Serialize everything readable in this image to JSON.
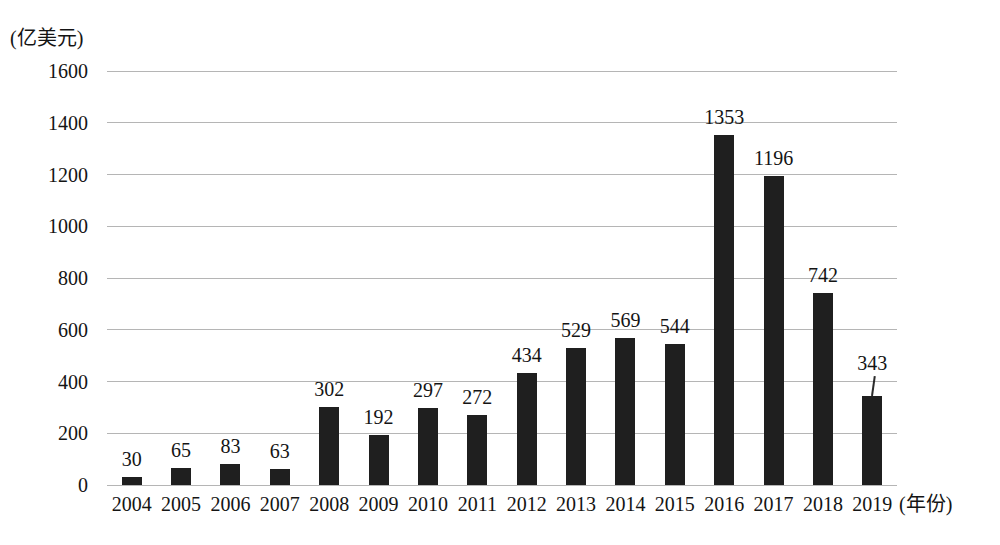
{
  "figure": {
    "background": "#ffffff",
    "text_color": "#141414"
  },
  "chart_data": {
    "type": "bar",
    "title": "",
    "ylabel": "(亿美元)",
    "xlabel": "(年份)",
    "categories": [
      "2004",
      "2005",
      "2006",
      "2007",
      "2008",
      "2009",
      "2010",
      "2011",
      "2012",
      "2013",
      "2014",
      "2015",
      "2016",
      "2017",
      "2018",
      "2019"
    ],
    "values": [
      30,
      65,
      83,
      63,
      302,
      192,
      297,
      272,
      434,
      529,
      569,
      544,
      1353,
      1196,
      742,
      343
    ],
    "ylim": [
      0,
      1600
    ],
    "ytick_step": 200,
    "yticks": [
      0,
      200,
      400,
      600,
      800,
      1000,
      1200,
      1400,
      1600
    ],
    "grid": true,
    "legend": "none",
    "bar_color": "#1f1f1f",
    "gridline_color": "#b5b5b5",
    "value_labels_shown": true,
    "callout_index": 15
  }
}
